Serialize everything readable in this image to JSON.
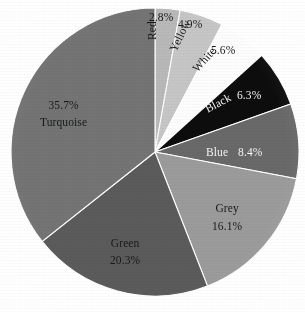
{
  "chart_data": {
    "type": "pie",
    "title": "",
    "subtitle": "",
    "xlabel": "",
    "ylabel": "",
    "legend_position": "none",
    "grid": false,
    "unit": "%",
    "start_angle_deg": 0,
    "direction": "clockwise",
    "categories": [
      "Red",
      "Yellow",
      "White",
      "Black",
      "Blue",
      "Grey",
      "Green",
      "Turquoise"
    ],
    "values": [
      2.8,
      4.9,
      5.6,
      6.3,
      8.4,
      16.1,
      20.3,
      35.7
    ],
    "slices": [
      {
        "name": "Red",
        "value": 2.8,
        "pct_text": "2.8%",
        "color": "#b9b9b9",
        "label_color": "#17191a",
        "label_rotation": -90
      },
      {
        "name": "Yellow",
        "value": 4.9,
        "pct_text": "4.9%",
        "color": "#c6c6c6",
        "label_color": "#17191a",
        "label_rotation": -63
      },
      {
        "name": "White",
        "value": 5.6,
        "pct_text": "5.6%",
        "color": "#fdfdfd",
        "label_color": "#17191a",
        "label_rotation": -46
      },
      {
        "name": "Black",
        "value": 6.3,
        "pct_text": "6.3%",
        "color": "#0d0d0d",
        "label_color": "#f4f4f4",
        "label_rotation": -28
      },
      {
        "name": "Blue",
        "value": 8.4,
        "pct_text": "8.4%",
        "color": "#696969",
        "label_color": "#f4f4f4",
        "label_rotation": 0
      },
      {
        "name": "Grey",
        "value": 16.1,
        "pct_text": "16.1%",
        "color": "#9b9b9b",
        "label_color": "#17191a",
        "label_rotation": 0
      },
      {
        "name": "Green",
        "value": 20.3,
        "pct_text": "20.3%",
        "color": "#5b5b5b",
        "label_color": "#17191a",
        "label_rotation": 0
      },
      {
        "name": "Turquoise",
        "value": 35.7,
        "pct_text": "35.7%",
        "color": "#747474",
        "label_color": "#17191a",
        "label_rotation": 0
      }
    ],
    "geometry": {
      "center_x": 155,
      "center_y": 152,
      "radius": 144,
      "background": "#ffffff",
      "slice_border": "#ffffff"
    }
  },
  "labels": {
    "red_name": "Red",
    "red_pct": "2.8%",
    "yellow_name": "Yellow",
    "yellow_pct": "4.9%",
    "white_name": "White",
    "white_pct": "5.6%",
    "black_name": "Black",
    "black_pct": "6.3%",
    "blue_name": "Blue",
    "blue_pct": "8.4%",
    "grey_name": "Grey",
    "grey_pct": "16.1%",
    "green_name": "Green",
    "green_pct": "20.3%",
    "turquoise_name": "Turquoise",
    "turquoise_pct": "35.7%"
  }
}
